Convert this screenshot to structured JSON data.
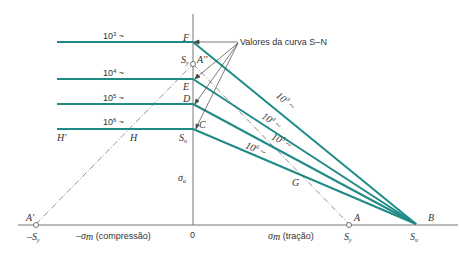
{
  "colors": {
    "teal": "#1f8a86",
    "axis": "#777777",
    "text": "#333333",
    "arrow": "#444444"
  },
  "callout": {
    "label": "Valores da curva S–N"
  },
  "horizontal_lines": [
    {
      "label_base": "10",
      "label_exp": "3",
      "label_suffix": " ~",
      "point": "F"
    },
    {
      "label_base": "10",
      "label_exp": "4",
      "label_suffix": " ~",
      "point": "E"
    },
    {
      "label_base": "10",
      "label_exp": "5",
      "label_suffix": " ~",
      "point": "D"
    },
    {
      "label_base": "10",
      "label_exp": "6",
      "label_suffix": " ~",
      "point": "C"
    }
  ],
  "diagonal_labels": [
    {
      "text": "10",
      "exp": "3",
      "suffix": " ~"
    },
    {
      "text": "10",
      "exp": "4",
      "suffix": " ~"
    },
    {
      "text": "10",
      "exp": "5",
      "suffix": " ~"
    },
    {
      "text": "10",
      "exp": "6",
      "suffix": " ~"
    }
  ],
  "points": {
    "F": "F",
    "E": "E",
    "D": "D",
    "C": "C",
    "A_double_prime": "A''",
    "A_prime": "A'",
    "A": "A",
    "B": "B",
    "G": "G",
    "H": "H",
    "H_prime": "H'"
  },
  "axis_labels": {
    "Sy_vertical": "S",
    "Sy_vertical_sub": "y",
    "Sn": "S",
    "Sn_sub": "n",
    "sigma_a": "σ",
    "sigma_a_sub": "a",
    "origin": "0",
    "neg_Sy": "–S",
    "neg_Sy_sub": "y",
    "Sy_horizontal": "S",
    "Sy_horizontal_sub": "y",
    "Su": "S",
    "Su_sub": "u",
    "compression_sigma": "–σ",
    "compression_sub": "m",
    "compression_text": " (compressão)",
    "tension_sigma": "σ",
    "tension_sub": "m",
    "tension_text": " (tração)"
  }
}
